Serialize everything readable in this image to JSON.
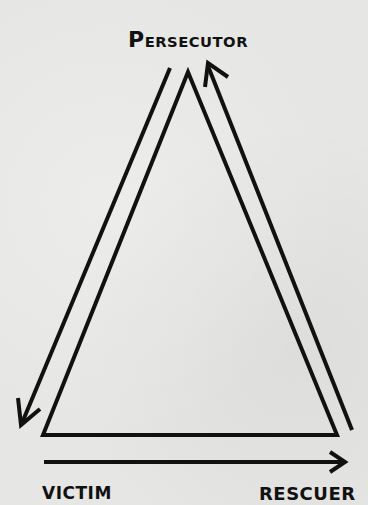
{
  "diagram": {
    "nodes": {
      "persecutor": {
        "label_first": "P",
        "label_rest": "ERSECUTOR",
        "full": "PERSECUTOR"
      },
      "victim": {
        "label": "VICTIM"
      },
      "rescuer": {
        "label": "RESCUER"
      }
    },
    "edges": [
      {
        "from": "persecutor",
        "to": "victim",
        "style": "arrow",
        "side": "left"
      },
      {
        "from": "rescuer",
        "to": "persecutor",
        "style": "arrow",
        "side": "right"
      },
      {
        "from": "victim",
        "to": "rescuer",
        "style": "arrow",
        "side": "bottom"
      }
    ],
    "colors": {
      "background": "#e6e6e4",
      "ink": "#111111"
    }
  }
}
